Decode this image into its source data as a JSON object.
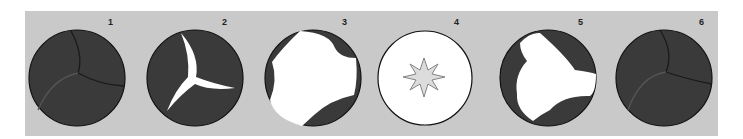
{
  "figure": {
    "background_color": "#c9c9c9",
    "leaflet_color": "#3a3a3a",
    "opening_color": "#ffffff",
    "valves": [
      {
        "label": "1",
        "state": "closed"
      },
      {
        "label": "2",
        "state": "opening-tri-slit"
      },
      {
        "label": "3",
        "state": "nearly-open"
      },
      {
        "label": "4",
        "state": "fully-open-star"
      },
      {
        "label": "5",
        "state": "closing"
      },
      {
        "label": "6",
        "state": "closed"
      }
    ]
  }
}
